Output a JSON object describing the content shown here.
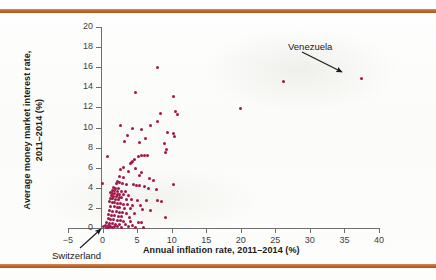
{
  "figure": {
    "background_color": "#fdfdfc",
    "rule_color": "#c2682f",
    "point_color": "#a3164a",
    "axis_color": "#6e6e6e"
  },
  "annotations": [
    {
      "id": "venezuela",
      "label": "Venezuela",
      "points_to_x": 37.5,
      "points_to_y": 14.9
    },
    {
      "id": "switzerland",
      "label": "Switzerland",
      "points_to_x": 0.2,
      "points_to_y": 0.1
    }
  ],
  "chart_data": {
    "type": "scatter",
    "title": "",
    "xlabel": "Annual inflation rate, 2011–2014 (%)",
    "ylabel": "Average money market interest rate, 2011–2014 (%)",
    "xlim": [
      -5,
      40
    ],
    "ylim": [
      0,
      20
    ],
    "xticks": [
      -5,
      0,
      5,
      10,
      15,
      20,
      25,
      30,
      35,
      40
    ],
    "yticks": [
      0,
      2,
      4,
      6,
      8,
      10,
      12,
      14,
      16,
      18,
      20
    ],
    "xtick_labels": [
      "−5",
      "0",
      "5",
      "10",
      "15",
      "20",
      "25",
      "30",
      "35",
      "40"
    ],
    "ytick_labels": [
      "0",
      "2",
      "4",
      "6",
      "8",
      "10",
      "12",
      "14",
      "16",
      "18",
      "20"
    ],
    "grid": false,
    "legend": false,
    "series": [
      {
        "name": "Countries",
        "color": "#a3164a",
        "points": [
          [
            37.5,
            14.9
          ],
          [
            26.2,
            14.6
          ],
          [
            20.0,
            11.9
          ],
          [
            7.9,
            16.0
          ],
          [
            4.7,
            13.5
          ],
          [
            10.3,
            13.1
          ],
          [
            10.6,
            11.6
          ],
          [
            8.4,
            11.4
          ],
          [
            10.8,
            11.3
          ],
          [
            2.6,
            10.2
          ],
          [
            8.0,
            10.6
          ],
          [
            6.9,
            10.2
          ],
          [
            4.3,
            9.9
          ],
          [
            5.6,
            9.8
          ],
          [
            9.4,
            9.5
          ],
          [
            10.2,
            9.4
          ],
          [
            3.6,
            9.2
          ],
          [
            10.4,
            9.1
          ],
          [
            6.2,
            8.9
          ],
          [
            3.2,
            8.6
          ],
          [
            5.3,
            8.5
          ],
          [
            9.0,
            8.4
          ],
          [
            9.3,
            7.8
          ],
          [
            9.1,
            7.5
          ],
          [
            5.6,
            7.2
          ],
          [
            6.5,
            7.2
          ],
          [
            6.0,
            7.2
          ],
          [
            5.2,
            7.1
          ],
          [
            0.7,
            7.1
          ],
          [
            4.6,
            6.8
          ],
          [
            4.4,
            6.6
          ],
          [
            4.2,
            6.5
          ],
          [
            4.0,
            6.4
          ],
          [
            3.1,
            6.0
          ],
          [
            4.7,
            5.9
          ],
          [
            2.6,
            5.8
          ],
          [
            3.7,
            5.6
          ],
          [
            5.7,
            5.5
          ],
          [
            5.4,
            5.2
          ],
          [
            2.5,
            5.1
          ],
          [
            3.0,
            5.0
          ],
          [
            6.8,
            4.9
          ],
          [
            7.4,
            4.7
          ],
          [
            2.1,
            4.6
          ],
          [
            2.4,
            4.5
          ],
          [
            2.0,
            4.4
          ],
          [
            0.0,
            4.4
          ],
          [
            2.9,
            4.4
          ],
          [
            3.4,
            4.3
          ],
          [
            10.3,
            4.3
          ],
          [
            4.5,
            4.3
          ],
          [
            4.9,
            4.2
          ],
          [
            5.3,
            4.2
          ],
          [
            6.1,
            4.1
          ],
          [
            1.6,
            4.0
          ],
          [
            1.9,
            3.9
          ],
          [
            2.3,
            3.9
          ],
          [
            6.6,
            3.9
          ],
          [
            7.8,
            3.8
          ],
          [
            1.4,
            3.7
          ],
          [
            1.7,
            3.7
          ],
          [
            2.2,
            3.6
          ],
          [
            2.7,
            3.6
          ],
          [
            3.3,
            3.6
          ],
          [
            1.2,
            3.5
          ],
          [
            1.5,
            3.4
          ],
          [
            1.8,
            3.4
          ],
          [
            2.1,
            3.3
          ],
          [
            2.5,
            3.3
          ],
          [
            3.1,
            3.3
          ],
          [
            3.8,
            3.2
          ],
          [
            1.3,
            3.2
          ],
          [
            1.6,
            3.1
          ],
          [
            2.0,
            3.1
          ],
          [
            2.4,
            3.0
          ],
          [
            2.8,
            3.0
          ],
          [
            1.1,
            2.9
          ],
          [
            1.5,
            2.9
          ],
          [
            1.9,
            2.8
          ],
          [
            2.3,
            2.8
          ],
          [
            3.5,
            2.8
          ],
          [
            4.2,
            2.8
          ],
          [
            5.0,
            2.7
          ],
          [
            6.3,
            2.7
          ],
          [
            7.9,
            2.7
          ],
          [
            8.6,
            2.6
          ],
          [
            1.0,
            2.6
          ],
          [
            1.4,
            2.5
          ],
          [
            1.8,
            2.5
          ],
          [
            2.2,
            2.4
          ],
          [
            2.6,
            2.4
          ],
          [
            3.0,
            2.3
          ],
          [
            3.6,
            2.3
          ],
          [
            4.4,
            2.2
          ],
          [
            5.5,
            2.2
          ],
          [
            1.2,
            2.1
          ],
          [
            1.7,
            2.1
          ],
          [
            2.1,
            2.0
          ],
          [
            2.5,
            2.0
          ],
          [
            3.2,
            1.9
          ],
          [
            4.0,
            1.9
          ],
          [
            5.8,
            1.8
          ],
          [
            6.9,
            1.7
          ],
          [
            1.0,
            1.7
          ],
          [
            1.5,
            1.6
          ],
          [
            2.0,
            1.6
          ],
          [
            2.4,
            1.5
          ],
          [
            2.9,
            1.5
          ],
          [
            3.4,
            1.4
          ],
          [
            4.6,
            1.4
          ],
          [
            0.9,
            1.3
          ],
          [
            1.3,
            1.2
          ],
          [
            1.8,
            1.2
          ],
          [
            2.3,
            1.1
          ],
          [
            2.8,
            1.1
          ],
          [
            3.9,
            1.0
          ],
          [
            9.1,
            1.0
          ],
          [
            0.8,
            0.9
          ],
          [
            1.2,
            0.8
          ],
          [
            1.6,
            0.8
          ],
          [
            2.1,
            0.7
          ],
          [
            2.6,
            0.7
          ],
          [
            3.1,
            0.6
          ],
          [
            4.1,
            0.6
          ],
          [
            5.2,
            0.5
          ],
          [
            5.7,
            0.5
          ],
          [
            0.6,
            0.5
          ],
          [
            1.0,
            0.4
          ],
          [
            1.4,
            0.4
          ],
          [
            1.9,
            0.3
          ],
          [
            2.4,
            0.3
          ],
          [
            3.3,
            0.3
          ],
          [
            4.3,
            0.2
          ],
          [
            0.4,
            0.2
          ],
          [
            0.8,
            0.2
          ],
          [
            1.2,
            0.1
          ],
          [
            1.7,
            0.1
          ],
          [
            2.2,
            0.1
          ],
          [
            3.7,
            0.1
          ],
          [
            0.2,
            0.1
          ],
          [
            0.5,
            0.05
          ],
          [
            0.9,
            0.05
          ],
          [
            1.5,
            0.05
          ],
          [
            2.8,
            0.05
          ],
          [
            4.8,
            0.05
          ],
          [
            5.9,
            0.05
          ]
        ]
      }
    ]
  }
}
